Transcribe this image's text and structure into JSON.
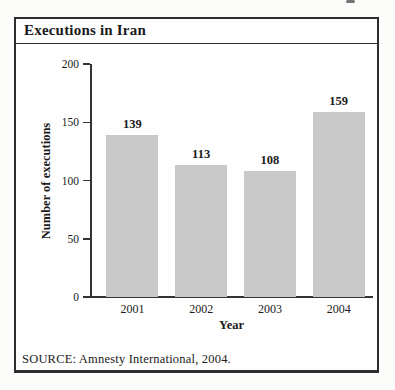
{
  "figure": {
    "title": "Executions in Iran",
    "source_note": "SOURCE: Amnesty International, 2004."
  },
  "chart_data": {
    "type": "bar",
    "title": "Executions in Iran",
    "categories": [
      "2001",
      "2002",
      "2003",
      "2004"
    ],
    "values": [
      139,
      113,
      108,
      159
    ],
    "data_labels": [
      "139",
      "113",
      "108",
      "159"
    ],
    "xlabel": "Year",
    "ylabel": "Number of executions",
    "ylim": [
      0,
      200
    ],
    "yticks": [
      0,
      50,
      100,
      150,
      200
    ],
    "grid": false,
    "legend": "none",
    "bar_color": "#c9c9c9",
    "axis_color": "#333333",
    "source": "SOURCE: Amnesty International, 2004."
  },
  "colors": {
    "page_background": "#fcfcfb",
    "box_background": "#fefefe",
    "border": "#2e2e2e",
    "text": "#1b1b1b"
  }
}
